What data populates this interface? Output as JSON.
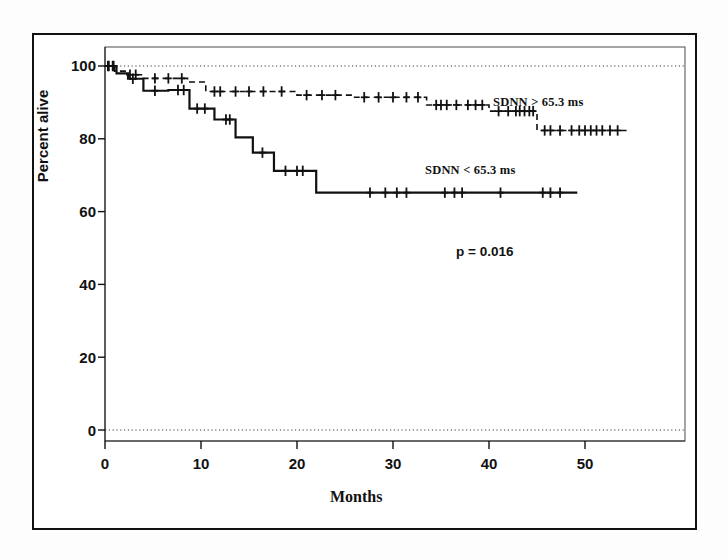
{
  "chart_data": {
    "type": "line",
    "subtype": "kaplan-meier-survival",
    "title": "",
    "xlabel": "Months",
    "ylabel": "Percent alive",
    "xlim": [
      0,
      60
    ],
    "ylim": [
      0,
      100
    ],
    "xticks": [
      0,
      10,
      20,
      30,
      40,
      50
    ],
    "xtick_labels": [
      "0",
      "10",
      "20",
      "30",
      "40",
      "50"
    ],
    "yticks": [
      0,
      20,
      40,
      60,
      80,
      100
    ],
    "ytick_labels": [
      "0",
      "20",
      "40",
      "60",
      "80",
      "100"
    ],
    "grid": false,
    "reference_lines": [
      {
        "value": 100,
        "style": "dotted"
      },
      {
        "value": 0,
        "style": "dotted"
      }
    ],
    "legend_position": "inline-annotation",
    "annotations": [
      {
        "text": "SDNN > 65.3 ms",
        "x": 40.5,
        "y": 90.5
      },
      {
        "text": "SDNN < 65.3 ms",
        "x": 33.0,
        "y": 72.5
      },
      {
        "text": "p = 0.016",
        "x": 38.0,
        "y": 50.0
      }
    ],
    "series": [
      {
        "name": "SDNN > 65.3 ms",
        "label": "SDNN > 65.3 ms",
        "style": "dashed",
        "color": "#111111",
        "steps": [
          [
            0,
            100
          ],
          [
            1.0,
            100
          ],
          [
            1.0,
            98.6
          ],
          [
            2.2,
            98.6
          ],
          [
            2.2,
            97.6
          ],
          [
            4.0,
            97.6
          ],
          [
            4.0,
            96.6
          ],
          [
            8.6,
            96.6
          ],
          [
            8.6,
            95.6
          ],
          [
            10.5,
            95.6
          ],
          [
            10.5,
            93.0
          ],
          [
            20.0,
            93.0
          ],
          [
            20.0,
            92.0
          ],
          [
            26.0,
            92.0
          ],
          [
            26.0,
            91.4
          ],
          [
            33.5,
            91.4
          ],
          [
            33.5,
            89.3
          ],
          [
            40.0,
            89.3
          ],
          [
            40.0,
            87.6
          ],
          [
            45.0,
            87.6
          ],
          [
            45.0,
            82.3
          ],
          [
            54.5,
            82.3
          ]
        ],
        "censor_marks": [
          [
            0.3,
            100
          ],
          [
            0.8,
            100
          ],
          [
            2.6,
            97.6
          ],
          [
            3.2,
            97.6
          ],
          [
            5.2,
            96.6
          ],
          [
            6.6,
            96.6
          ],
          [
            8.0,
            96.6
          ],
          [
            11.4,
            93.0
          ],
          [
            12.0,
            93.0
          ],
          [
            13.6,
            93.0
          ],
          [
            15.0,
            93.0
          ],
          [
            16.5,
            93.0
          ],
          [
            18.4,
            93.0
          ],
          [
            21.0,
            92.0
          ],
          [
            22.6,
            92.0
          ],
          [
            24.0,
            92.0
          ],
          [
            27.0,
            91.4
          ],
          [
            28.5,
            91.4
          ],
          [
            30.0,
            91.4
          ],
          [
            31.4,
            91.4
          ],
          [
            32.6,
            91.4
          ],
          [
            34.5,
            89.3
          ],
          [
            35.0,
            89.3
          ],
          [
            35.6,
            89.3
          ],
          [
            36.6,
            89.3
          ],
          [
            37.8,
            89.3
          ],
          [
            38.6,
            89.3
          ],
          [
            39.3,
            89.3
          ],
          [
            41.0,
            87.6
          ],
          [
            42.0,
            87.6
          ],
          [
            42.8,
            87.6
          ],
          [
            43.2,
            87.6
          ],
          [
            43.7,
            87.6
          ],
          [
            44.2,
            87.6
          ],
          [
            44.6,
            87.6
          ],
          [
            45.8,
            82.3
          ],
          [
            46.4,
            82.3
          ],
          [
            47.4,
            82.3
          ],
          [
            48.6,
            82.3
          ],
          [
            49.4,
            82.3
          ],
          [
            50.0,
            82.3
          ],
          [
            50.6,
            82.3
          ],
          [
            51.2,
            82.3
          ],
          [
            51.8,
            82.3
          ],
          [
            52.6,
            82.3
          ],
          [
            53.4,
            82.3
          ]
        ]
      },
      {
        "name": "SDNN < 65.3 ms",
        "label": "SDNN < 65.3 ms",
        "style": "solid",
        "color": "#111111",
        "steps": [
          [
            0,
            100
          ],
          [
            1.2,
            100
          ],
          [
            1.2,
            98.0
          ],
          [
            2.4,
            98.0
          ],
          [
            2.4,
            96.5
          ],
          [
            4.0,
            96.5
          ],
          [
            4.0,
            93.2
          ],
          [
            6.6,
            93.2
          ],
          [
            6.6,
            93.4
          ],
          [
            8.8,
            93.4
          ],
          [
            8.8,
            88.3
          ],
          [
            11.4,
            88.3
          ],
          [
            11.4,
            85.3
          ],
          [
            13.6,
            85.3
          ],
          [
            13.6,
            80.4
          ],
          [
            15.4,
            80.4
          ],
          [
            15.4,
            76.2
          ],
          [
            17.6,
            76.2
          ],
          [
            17.6,
            71.2
          ],
          [
            22.0,
            71.2
          ],
          [
            22.0,
            65.2
          ],
          [
            49.2,
            65.2
          ]
        ],
        "censor_marks": [
          [
            0.4,
            100
          ],
          [
            0.9,
            100
          ],
          [
            2.9,
            96.5
          ],
          [
            5.2,
            93.2
          ],
          [
            7.6,
            93.4
          ],
          [
            8.2,
            93.4
          ],
          [
            9.6,
            88.3
          ],
          [
            10.4,
            88.3
          ],
          [
            12.6,
            85.3
          ],
          [
            13.0,
            85.3
          ],
          [
            16.4,
            76.2
          ],
          [
            18.8,
            71.2
          ],
          [
            20.0,
            71.2
          ],
          [
            20.6,
            71.2
          ],
          [
            27.6,
            65.2
          ],
          [
            29.2,
            65.2
          ],
          [
            30.4,
            65.2
          ],
          [
            31.4,
            65.2
          ],
          [
            35.4,
            65.2
          ],
          [
            36.4,
            65.2
          ],
          [
            37.2,
            65.2
          ],
          [
            41.2,
            65.2
          ],
          [
            45.6,
            65.2
          ],
          [
            46.4,
            65.2
          ],
          [
            47.4,
            65.2
          ]
        ]
      }
    ]
  },
  "axes": {
    "y_title": "Percent alive",
    "x_title": "Months",
    "y_labels": [
      "100",
      "80",
      "60",
      "40",
      "20",
      "0"
    ],
    "x_labels": [
      "0",
      "10",
      "20",
      "30",
      "40",
      "50"
    ]
  },
  "labels": {
    "series_high": "SDNN > 65.3 ms",
    "series_low": "SDNN < 65.3 ms",
    "pvalue": "p = 0.016"
  },
  "colors": {
    "ink": "#111111",
    "background": "#ffffff",
    "frame": "#111111"
  }
}
